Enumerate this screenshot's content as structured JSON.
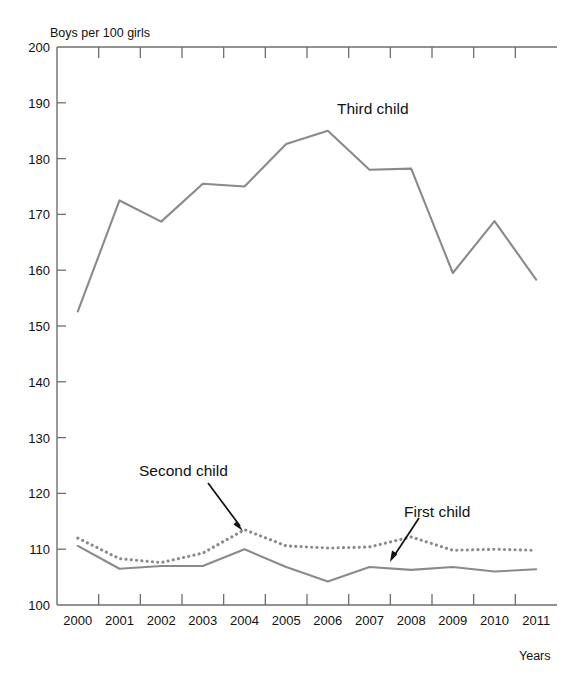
{
  "chart_data": {
    "type": "line",
    "title": "",
    "ylabel": "Boys per 100 girls",
    "xlabel": "Years",
    "categories": [
      "2000",
      "2001",
      "2002",
      "2003",
      "2004",
      "2005",
      "2006",
      "2007",
      "2008",
      "2009",
      "2010",
      "2011"
    ],
    "ylim": [
      100,
      200
    ],
    "ytick_labels": [
      "100",
      "110",
      "120",
      "130",
      "140",
      "150",
      "160",
      "170",
      "180",
      "190",
      "200"
    ],
    "ytick_values": [
      100,
      110,
      120,
      130,
      140,
      150,
      160,
      170,
      180,
      190,
      200
    ],
    "grid": false,
    "legend": "inline-annotations",
    "series": [
      {
        "name": "First child",
        "style": "solid",
        "color": "#8a8a8a",
        "values": [
          110.6,
          106.5,
          107.0,
          107.0,
          110.0,
          106.8,
          104.2,
          106.8,
          106.3,
          106.8,
          106.0,
          106.4
        ]
      },
      {
        "name": "Second child",
        "style": "dotted",
        "color": "#8a8a8a",
        "values": [
          112.0,
          108.3,
          107.6,
          109.3,
          113.5,
          110.6,
          110.2,
          110.4,
          112.2,
          109.8,
          110.0,
          109.8
        ]
      },
      {
        "name": "Third child",
        "style": "solid",
        "color": "#8a8a8a",
        "values": [
          152.6,
          172.5,
          168.7,
          175.5,
          175.0,
          182.6,
          185.0,
          178.0,
          178.2,
          159.5,
          168.8,
          158.3
        ]
      }
    ],
    "annotations": [
      {
        "text": "Third child",
        "points_to": "third-child-line"
      },
      {
        "text": "Second child",
        "points_to": "second-child-2004-peak"
      },
      {
        "text": "First child",
        "points_to": "first-child-2008"
      }
    ]
  }
}
